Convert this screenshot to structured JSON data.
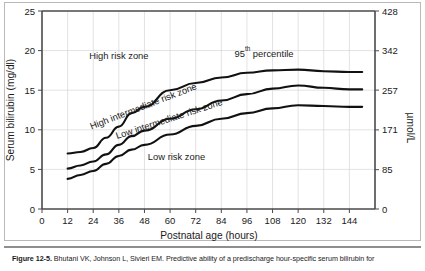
{
  "figure": {
    "caption_number": "Figure 12-5.",
    "caption_body": "Bhutani VK, Johnson L, Sivieri EM. Predictive ability of a predischarge hour-specific serum bilirubin for"
  },
  "colors": {
    "curve": "#111111",
    "axis": "#4a4a4a",
    "grid": "#cfcfcf",
    "frame": "#b9b9b9",
    "text": "#1a1a1a",
    "background": "#ffffff"
  },
  "chart_data": {
    "type": "line",
    "title": "",
    "xlabel": "Postnatal age (hours)",
    "ylabel": "Serum bilirubin (mg/dl)",
    "y2label": "µmol/L",
    "xlim": [
      0,
      156
    ],
    "ylim": [
      0,
      25
    ],
    "y2lim": [
      0,
      428
    ],
    "grid": true,
    "legend_position": "inline-annotations",
    "xticks": [
      0,
      12,
      24,
      36,
      48,
      60,
      72,
      84,
      96,
      108,
      120,
      132,
      144
    ],
    "xticklabels": [
      "0",
      "12",
      "24",
      "36",
      "48",
      "60",
      "72",
      "84",
      "96",
      "108",
      "120",
      "132",
      "144"
    ],
    "yticks": [
      0,
      5,
      10,
      15,
      20,
      25
    ],
    "yticklabels": [
      "0",
      "5",
      "10",
      "15",
      "20",
      "25"
    ],
    "y2ticks": [
      0,
      85,
      171,
      257,
      342,
      428
    ],
    "y2ticklabels": [
      "0",
      "85",
      "171",
      "257",
      "342",
      "428"
    ],
    "x": [
      12,
      18,
      24,
      30,
      36,
      42,
      48,
      60,
      72,
      84,
      96,
      108,
      120,
      132,
      144,
      150
    ],
    "series": [
      {
        "name": "95th percentile",
        "values": [
          7.0,
          7.2,
          7.7,
          9.0,
          10.4,
          12.1,
          12.9,
          15.0,
          15.9,
          16.6,
          17.2,
          17.5,
          17.6,
          17.4,
          17.3,
          17.3
        ]
      },
      {
        "name": "75th percentile",
        "values": [
          5.1,
          5.5,
          6.0,
          6.9,
          8.1,
          9.2,
          9.9,
          11.4,
          12.6,
          13.7,
          14.5,
          15.2,
          15.6,
          15.3,
          15.1,
          15.1
        ]
      },
      {
        "name": "40th percentile",
        "values": [
          3.8,
          4.3,
          4.8,
          5.7,
          6.7,
          7.5,
          8.1,
          9.4,
          10.5,
          11.4,
          12.1,
          12.7,
          13.1,
          13.0,
          12.9,
          12.9
        ]
      }
    ],
    "annotations": [
      {
        "text": "High risk zone",
        "x": 36,
        "y": 19.0,
        "rotation": 0
      },
      {
        "text": "High intermediate risk zone",
        "x": 48,
        "y": 12.6,
        "rotation": -21
      },
      {
        "text": "Low intermediate risk zone",
        "x": 60,
        "y": 11.0,
        "rotation": -18
      },
      {
        "text": "Low risk zone",
        "x": 63,
        "y": 6.2,
        "rotation": 0
      },
      {
        "text": "95",
        "superscript": "th",
        "suffix": " percentile",
        "x": 104,
        "y": 19.2,
        "rotation": 0
      }
    ]
  }
}
